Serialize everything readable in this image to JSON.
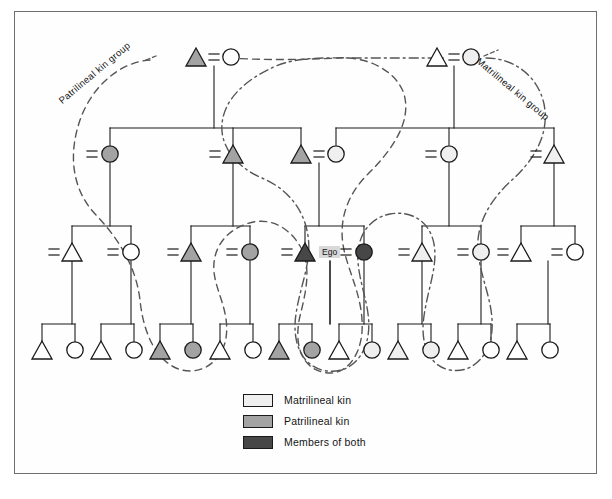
{
  "figure": {
    "width": 612,
    "height": 499
  },
  "colors": {
    "matrilineal": "#efefef",
    "patrilineal": "#a3a3a3",
    "both": "#474747",
    "none": "#ffffff",
    "stroke": "#1a1a1a",
    "patri_line": "#555555",
    "matri_line": "#555555",
    "frame": "#6e6e6e",
    "ego_box_bg": "#d9d9d9"
  },
  "group_labels": {
    "patrilineal": "Patrilineal kin group",
    "matrilineal": "Matrilineal kin group"
  },
  "ego": {
    "label": "Ego",
    "x": 330,
    "y": 252
  },
  "legend": {
    "items": [
      {
        "label": "Matrilineal kin",
        "fill": "#efefef"
      },
      {
        "label": "Patrilineal kin",
        "fill": "#a3a3a3"
      },
      {
        "label": "Members of both",
        "fill": "#474747"
      }
    ]
  },
  "chart_data": {
    "type": "diagram",
    "diagram_kind": "kinship-genealogy",
    "generations": 4,
    "symbol_legend": {
      "triangle": "male",
      "circle": "female",
      "equals": "marriage",
      "vertical-line": "descent"
    },
    "nodes": [
      {
        "id": "g1-m-l",
        "gen": 1,
        "shape": "triangle",
        "fill": "patrilineal",
        "x": 196,
        "y": 57
      },
      {
        "id": "g1-f-l",
        "gen": 1,
        "shape": "circle",
        "fill": "none",
        "x": 231,
        "y": 57
      },
      {
        "id": "g1-m-r",
        "gen": 1,
        "shape": "triangle",
        "fill": "none",
        "x": 437,
        "y": 57
      },
      {
        "id": "g1-f-r",
        "gen": 1,
        "shape": "circle",
        "fill": "matrilineal",
        "x": 471,
        "y": 57
      },
      {
        "id": "g2-a",
        "gen": 2,
        "shape": "circle",
        "fill": "patrilineal",
        "x": 110,
        "y": 154
      },
      {
        "id": "g2-b",
        "gen": 2,
        "shape": "triangle",
        "fill": "patrilineal",
        "x": 233,
        "y": 154
      },
      {
        "id": "g2-c",
        "gen": 2,
        "shape": "triangle",
        "fill": "patrilineal",
        "x": 301,
        "y": 154
      },
      {
        "id": "g2-d",
        "gen": 2,
        "shape": "circle",
        "fill": "matrilineal",
        "x": 336,
        "y": 154
      },
      {
        "id": "g2-e",
        "gen": 2,
        "shape": "circle",
        "fill": "matrilineal",
        "x": 449,
        "y": 154
      },
      {
        "id": "g2-f",
        "gen": 2,
        "shape": "triangle",
        "fill": "matrilineal",
        "x": 554,
        "y": 154
      },
      {
        "id": "g3-a",
        "gen": 3,
        "shape": "triangle",
        "fill": "none",
        "x": 72,
        "y": 252
      },
      {
        "id": "g3-b",
        "gen": 3,
        "shape": "circle",
        "fill": "none",
        "x": 131,
        "y": 252
      },
      {
        "id": "g3-c",
        "gen": 3,
        "shape": "triangle",
        "fill": "patrilineal",
        "x": 191,
        "y": 252
      },
      {
        "id": "g3-d",
        "gen": 3,
        "shape": "circle",
        "fill": "patrilineal",
        "x": 250,
        "y": 252
      },
      {
        "id": "g3-e",
        "gen": 3,
        "shape": "triangle",
        "fill": "both",
        "x": 305,
        "y": 252
      },
      {
        "id": "g3-f",
        "gen": 3,
        "shape": "circle",
        "fill": "both",
        "x": 364,
        "y": 252
      },
      {
        "id": "g3-g",
        "gen": 3,
        "shape": "triangle",
        "fill": "matrilineal",
        "x": 422,
        "y": 252
      },
      {
        "id": "g3-h",
        "gen": 3,
        "shape": "circle",
        "fill": "matrilineal",
        "x": 481,
        "y": 252
      },
      {
        "id": "g3-i",
        "gen": 3,
        "shape": "triangle",
        "fill": "none",
        "x": 521,
        "y": 252
      },
      {
        "id": "g3-j",
        "gen": 3,
        "shape": "circle",
        "fill": "none",
        "x": 575,
        "y": 252
      },
      {
        "id": "g4-01",
        "gen": 4,
        "shape": "triangle",
        "fill": "none",
        "x": 42,
        "y": 350
      },
      {
        "id": "g4-02",
        "gen": 4,
        "shape": "circle",
        "fill": "none",
        "x": 75,
        "y": 350
      },
      {
        "id": "g4-03",
        "gen": 4,
        "shape": "triangle",
        "fill": "none",
        "x": 101,
        "y": 350
      },
      {
        "id": "g4-04",
        "gen": 4,
        "shape": "circle",
        "fill": "none",
        "x": 134,
        "y": 350
      },
      {
        "id": "g4-05",
        "gen": 4,
        "shape": "triangle",
        "fill": "patrilineal",
        "x": 160,
        "y": 350
      },
      {
        "id": "g4-06",
        "gen": 4,
        "shape": "circle",
        "fill": "patrilineal",
        "x": 193,
        "y": 350
      },
      {
        "id": "g4-07",
        "gen": 4,
        "shape": "triangle",
        "fill": "none",
        "x": 220,
        "y": 350
      },
      {
        "id": "g4-08",
        "gen": 4,
        "shape": "circle",
        "fill": "none",
        "x": 253,
        "y": 350
      },
      {
        "id": "g4-09",
        "gen": 4,
        "shape": "triangle",
        "fill": "patrilineal",
        "x": 279,
        "y": 350
      },
      {
        "id": "g4-10",
        "gen": 4,
        "shape": "circle",
        "fill": "patrilineal",
        "x": 312,
        "y": 350
      },
      {
        "id": "g4-11",
        "gen": 4,
        "shape": "triangle",
        "fill": "none",
        "x": 339,
        "y": 350
      },
      {
        "id": "g4-12",
        "gen": 4,
        "shape": "circle",
        "fill": "matrilineal",
        "x": 372,
        "y": 350
      },
      {
        "id": "g4-13",
        "gen": 4,
        "shape": "triangle",
        "fill": "matrilineal",
        "x": 398,
        "y": 350
      },
      {
        "id": "g4-14",
        "gen": 4,
        "shape": "circle",
        "fill": "matrilineal",
        "x": 431,
        "y": 350
      },
      {
        "id": "g4-15",
        "gen": 4,
        "shape": "triangle",
        "fill": "none",
        "x": 458,
        "y": 350
      },
      {
        "id": "g4-16",
        "gen": 4,
        "shape": "circle",
        "fill": "none",
        "x": 491,
        "y": 350
      },
      {
        "id": "g4-17",
        "gen": 4,
        "shape": "triangle",
        "fill": "none",
        "x": 517,
        "y": 350
      },
      {
        "id": "g4-18",
        "gen": 4,
        "shape": "circle",
        "fill": "none",
        "x": 550,
        "y": 350
      }
    ],
    "marriage_marks": [
      {
        "x": 214,
        "y": 57
      },
      {
        "x": 454,
        "y": 57
      },
      {
        "x": 92,
        "y": 154
      },
      {
        "x": 215,
        "y": 154
      },
      {
        "x": 319,
        "y": 154
      },
      {
        "x": 431,
        "y": 154
      },
      {
        "x": 536,
        "y": 154
      },
      {
        "x": 54,
        "y": 252
      },
      {
        "x": 113,
        "y": 252
      },
      {
        "x": 173,
        "y": 252
      },
      {
        "x": 232,
        "y": 252
      },
      {
        "x": 287,
        "y": 252
      },
      {
        "x": 346,
        "y": 252
      },
      {
        "x": 404,
        "y": 252
      },
      {
        "x": 463,
        "y": 252
      },
      {
        "x": 503,
        "y": 252
      },
      {
        "x": 557,
        "y": 252
      }
    ]
  }
}
